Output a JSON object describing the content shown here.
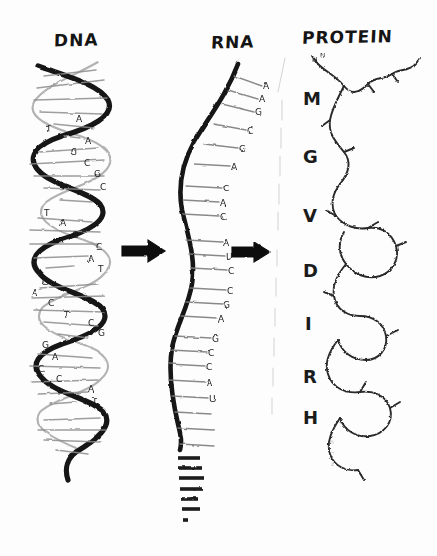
{
  "figure": {
    "kind": "hand-drawn-diagram",
    "background_color": "#fdfdfd",
    "ink_color": "#1b1b1b"
  },
  "panels": [
    {
      "id": "dna",
      "title": "DNA"
    },
    {
      "id": "rna",
      "title": "RNA"
    },
    {
      "id": "protein",
      "title": "PROTEIN"
    }
  ],
  "titles": {
    "dna": "DNA",
    "rna": "RNA",
    "protein": "PROTEIN"
  },
  "dna": {
    "structure": "double-helix",
    "base_labels": [
      "A",
      "T",
      "A",
      "G",
      "C",
      "G",
      "C",
      "T",
      "A",
      "G",
      "C",
      "A",
      "T",
      "G",
      "A",
      "C",
      "T",
      "C",
      "G",
      "G",
      "A",
      "C",
      "C",
      "A",
      "T"
    ]
  },
  "rna": {
    "structure": "single-strand",
    "base_labels": [
      "A",
      "A",
      "G",
      "C",
      "G",
      "A",
      "C",
      "A",
      "C",
      "A",
      "U",
      "C",
      "C",
      "G",
      "A",
      "G",
      "C",
      "C",
      "A",
      "U"
    ],
    "tail_note": "strand continues as short rungs toward bottom"
  },
  "protein": {
    "structure": "folded-chain",
    "amino_acid_labels": [
      "M",
      "G",
      "V",
      "D",
      "I",
      "R",
      "H"
    ]
  },
  "arrows": [
    {
      "id": "arrow-dna-to-rna",
      "label": "",
      "direction": "right"
    },
    {
      "id": "arrow-rna-to-protein",
      "label": "",
      "direction": "right"
    }
  ]
}
